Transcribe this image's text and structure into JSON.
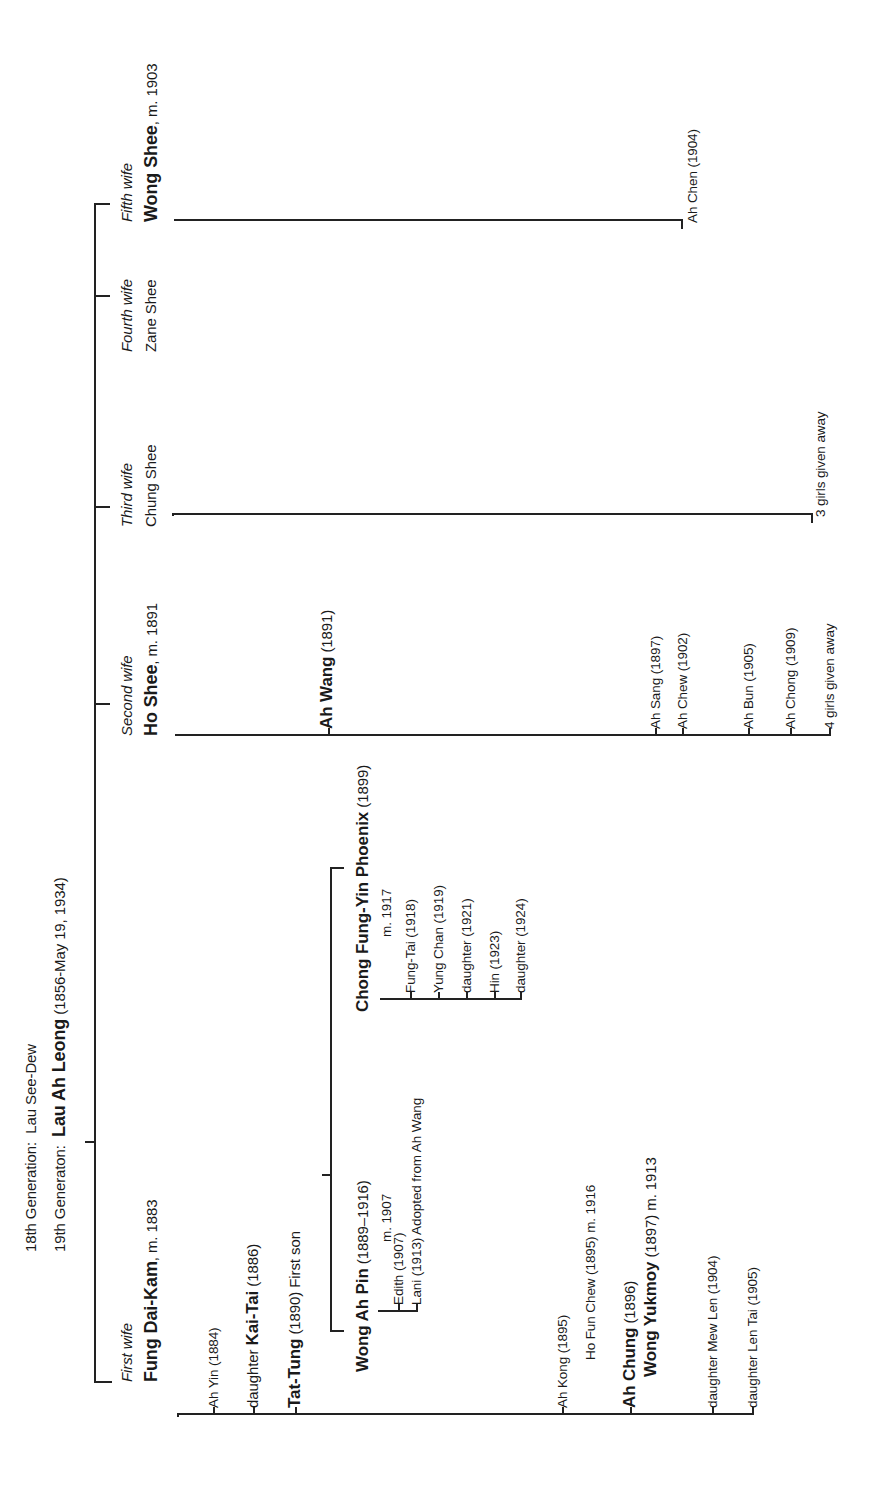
{
  "header": {
    "gen18_label": "18th Generation:",
    "gen18_name": "Lau See-Dew",
    "gen19_label": "19th Generaton:",
    "gen19_name": "Lau Ah Leong",
    "gen19_dates": "(1856-May 19, 1934)"
  },
  "wives": [
    {
      "ordinal": "First wife",
      "name": "Fung Dai-Kam",
      "note": ", m. 1883",
      "children": [
        {
          "name": "Ah Yin (1884)"
        },
        {
          "prefix": "daughter ",
          "name": "Kai-Tai",
          "note": " (1886)"
        },
        {
          "name": "Tat-Tung",
          "note": " (1890) First son"
        },
        {
          "name": "Ah Kong (1895)"
        },
        {
          "name": "Ah Chung",
          "note": " (1896)"
        },
        {
          "name": "daughter Mew Len (1904)"
        },
        {
          "name": "daughter Len Tai (1905)"
        }
      ]
    },
    {
      "ordinal": "Second wife",
      "name": "Ho Shee",
      "note": ", m. 1891",
      "children": [
        {
          "name": "Ah Wang",
          "note": " (1891)"
        },
        {
          "name": "Ah Sang (1897)"
        },
        {
          "name": "Ah Chew (1902)"
        },
        {
          "name": "Ah Bun (1905)"
        },
        {
          "name": "Ah Chong (1909)"
        },
        {
          "name": "4 girls given away"
        }
      ]
    },
    {
      "ordinal": "Third wife",
      "name": "Chung Shee",
      "children": [
        {
          "name": "3 girls given away"
        }
      ]
    },
    {
      "ordinal": "Fourth wife",
      "name": "Zane Shee"
    },
    {
      "ordinal": "Fifth wife",
      "name": "Wong Shee",
      "note": ", m. 1903",
      "children": [
        {
          "name": "Ah Chen (1904)"
        }
      ]
    }
  ],
  "tat_tung_spouses": [
    {
      "name": "Wong Ah Pin",
      "dates": " (1889–1916)",
      "married": "m. 1907",
      "children": [
        "Edith (1907)",
        "Lani (1913) Adopted from Ah Wang"
      ]
    },
    {
      "name": "Chong Fung-Yin Phoenix",
      "dates": " (1899)",
      "married": "m. 1917",
      "children": [
        "Fung-Tai (1918)",
        "Yung Chan (1919)",
        "daughter (1921)",
        "Hin (1923)",
        "daughter (1924)"
      ]
    }
  ],
  "ah_kong_spouse": "Ho Fun Chew (1895) m. 1916",
  "ah_chung_spouse": {
    "name": "Wong Yukmoy",
    "note": " (1897) m. 1913"
  }
}
